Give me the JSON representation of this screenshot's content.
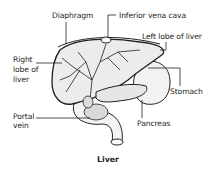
{
  "diagram": {
    "title": "Liver",
    "labels": {
      "diaphragm": "Diaphragm",
      "inferior_vena_cava": "Inferior vena cava",
      "left_lobe": "Left lobe of liver",
      "right_lobe_1": "Right",
      "right_lobe_2": "lobe of",
      "right_lobe_3": "liver",
      "stomach": "Stomach",
      "portal_vein_1": "Portal",
      "portal_vein_2": "vein",
      "pancreas": "Pancreas"
    },
    "colors": {
      "ink": "#231f20",
      "organ_fill": "#f2f2f2",
      "shade": "#cfcfcf"
    }
  }
}
